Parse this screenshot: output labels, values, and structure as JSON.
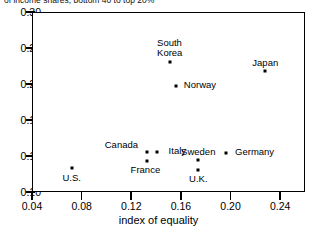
{
  "caption": "of income shares, bottom 40 to top 20%",
  "chart_data": {
    "type": "scatter",
    "title": "",
    "xlabel": "index of equality",
    "ylabel": "",
    "xlim": [
      0.04,
      0.26
    ],
    "ylim": [
      0.1,
      0.3
    ],
    "xticks": [
      "0.04",
      "0.08",
      "0.12",
      "0.16",
      "0.20",
      "0.24"
    ],
    "xtick_values": [
      0.04,
      0.08,
      0.12,
      0.16,
      0.2,
      0.24
    ],
    "yticks": [
      "0.30",
      "0.26",
      "0.22",
      "0.18",
      "0.14",
      "0.10"
    ],
    "ytick_values": [
      0.3,
      0.26,
      0.22,
      0.18,
      0.14,
      0.1
    ],
    "grid": false,
    "legend": "none",
    "points": [
      {
        "label": "U.S.",
        "x": 0.072,
        "y": 0.127,
        "label_pos": "below",
        "label_dx": 0,
        "label_dy": 5
      },
      {
        "label": "Canada",
        "x": 0.133,
        "y": 0.145,
        "label_pos": "above-left",
        "label_dx": -26,
        "label_dy": -12
      },
      {
        "label": "France",
        "x": 0.133,
        "y": 0.134,
        "label_pos": "below",
        "label_dx": -2,
        "label_dy": 4
      },
      {
        "label": "Italy",
        "x": 0.141,
        "y": 0.145,
        "label_pos": "right",
        "label_dx": 20,
        "label_dy": -6
      },
      {
        "label": "South\nKorea",
        "x": 0.151,
        "y": 0.245,
        "label_pos": "above",
        "label_dx": 0,
        "label_dy": -24
      },
      {
        "label": "Norway",
        "x": 0.156,
        "y": 0.218,
        "label_pos": "right",
        "label_dx": 24,
        "label_dy": -6
      },
      {
        "label": "Sweden",
        "x": 0.174,
        "y": 0.136,
        "label_pos": "above",
        "label_dx": 0,
        "label_dy": -13
      },
      {
        "label": "U.K.",
        "x": 0.174,
        "y": 0.125,
        "label_pos": "below",
        "label_dx": 0,
        "label_dy": 4
      },
      {
        "label": "Germany",
        "x": 0.196,
        "y": 0.143,
        "label_pos": "right",
        "label_dx": 29,
        "label_dy": -6
      },
      {
        "label": "Japan",
        "x": 0.228,
        "y": 0.235,
        "label_pos": "above",
        "label_dx": 0,
        "label_dy": -13
      }
    ]
  }
}
